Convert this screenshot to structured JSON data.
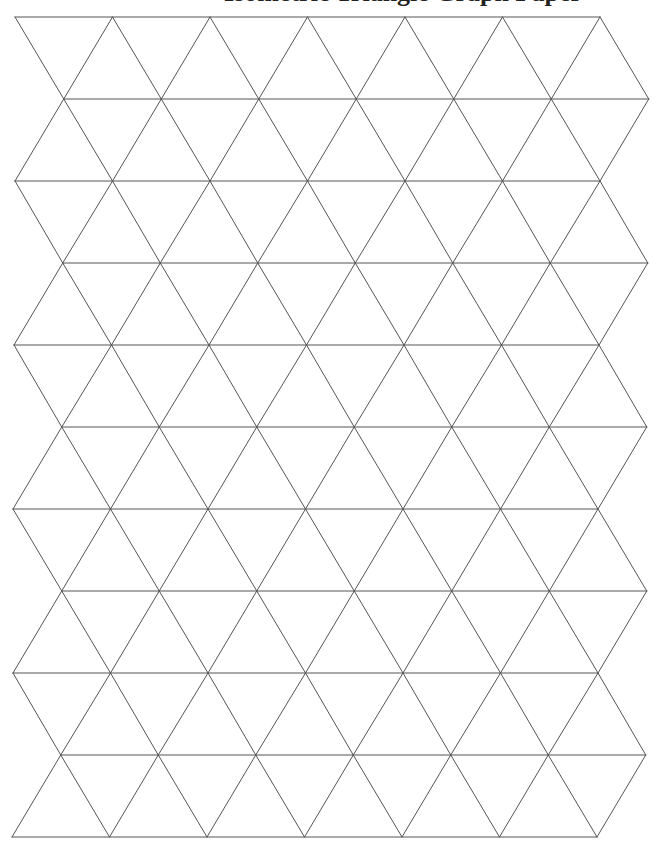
{
  "page": {
    "width": 666,
    "height": 855,
    "background": "#ffffff",
    "title_partial": "Isometric Triangle Graph Paper",
    "title_visible_note": "only descenders visible at top edge"
  },
  "grid": {
    "type": "equilateral-triangle-tessellation",
    "line_color": "#555555",
    "line_width": 1,
    "row_count": 10,
    "horizontal_lines_y": [
      17,
      99,
      181,
      263,
      345,
      427,
      509,
      591,
      673,
      755,
      837
    ],
    "triangle_width": 97.5,
    "triangles_per_row": 6,
    "even_line_start_x": [
      15,
      15,
      15,
      14,
      14,
      13,
      13,
      13,
      13,
      12,
      12
    ],
    "odd_line_offset_x": 48.75,
    "zigzag_edges": "left and right edges zigzag between even and odd rows"
  }
}
